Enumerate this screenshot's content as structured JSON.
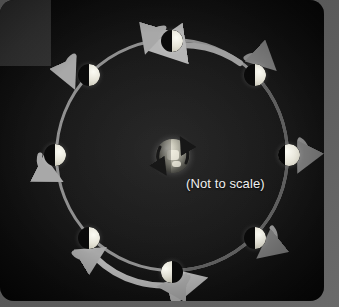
{
  "diagram": {
    "caption": "(Not to scale)",
    "center_body": {
      "name": "Earth",
      "rotation_label": "rotation",
      "rotation_direction": "counterclockwise"
    },
    "orbit": {
      "direction": "counterclockwise",
      "ring_color": "#9a9a9a",
      "ring_shadow_color": "#5a5a5a"
    },
    "colors": {
      "panel_background": "#101010",
      "backdrop": "#5c5c5c",
      "corner_block": "#3a3a3a",
      "moon_lit": "#e6e4d8",
      "moon_dark": "#060606",
      "caption_text": "#efefef",
      "arrow_light": "#b9b9b9",
      "arrow_dark": "#6e6e6e"
    },
    "moons": [
      {
        "position": "top",
        "angle_deg": 90,
        "phase": "new-moon",
        "lit_side": "right",
        "x": 172,
        "y": 41
      },
      {
        "position": "top-right",
        "angle_deg": 45,
        "phase": "waxing-crescent",
        "lit_side": "right",
        "x": 255,
        "y": 75
      },
      {
        "position": "right",
        "angle_deg": 0,
        "phase": "first-quarter",
        "lit_side": "right",
        "x": 289,
        "y": 155
      },
      {
        "position": "bottom-right",
        "angle_deg": -45,
        "phase": "waxing-gibbous",
        "lit_side": "right",
        "x": 255,
        "y": 238
      },
      {
        "position": "bottom",
        "angle_deg": -90,
        "phase": "full-moon",
        "lit_side": "left",
        "x": 172,
        "y": 272
      },
      {
        "position": "bottom-left",
        "angle_deg": -135,
        "phase": "waning-gibbous",
        "lit_side": "right",
        "x": 89,
        "y": 238
      },
      {
        "position": "left",
        "angle_deg": 180,
        "phase": "third-quarter",
        "lit_side": "right",
        "x": 55,
        "y": 155
      },
      {
        "position": "top-left",
        "angle_deg": 135,
        "phase": "waning-crescent",
        "lit_side": "right",
        "x": 89,
        "y": 75
      }
    ]
  }
}
